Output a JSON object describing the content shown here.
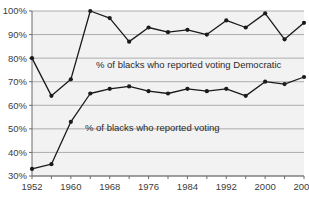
{
  "chart_data": {
    "type": "line",
    "title": "",
    "subtitle": "",
    "xlabel": "",
    "ylabel": "",
    "grid": true,
    "legend_position": "inline-annotations",
    "plot_background": "#f2f2f2",
    "series_color": "#1a1a1a",
    "xlim": [
      1952,
      2008
    ],
    "ylim": [
      30,
      100
    ],
    "x": [
      1952,
      1956,
      1960,
      1964,
      1968,
      1972,
      1976,
      1980,
      1984,
      1988,
      1992,
      1996,
      2000,
      2004,
      2008
    ],
    "xtick_labels": [
      "1952",
      "1960",
      "1968",
      "1976",
      "1984",
      "1992",
      "2000",
      "2008"
    ],
    "xticks": [
      1952,
      1960,
      1968,
      1976,
      1984,
      1992,
      2000,
      2008
    ],
    "ytick_labels": [
      "30%",
      "40%",
      "50%",
      "60%",
      "70%",
      "80%",
      "90%",
      "100%"
    ],
    "yticks": [
      30,
      40,
      50,
      60,
      70,
      80,
      90,
      100
    ],
    "series": [
      {
        "name": "% of blacks who reported voting Democratic",
        "annotation": "% of blacks who reported voting Democratic",
        "values": [
          80,
          64,
          71,
          100,
          97,
          87,
          93,
          91,
          92,
          90,
          96,
          93,
          99,
          88,
          95
        ]
      },
      {
        "name": "% of blacks who reported voting",
        "annotation": "% of blacks who reported voting",
        "values": [
          33,
          35,
          53,
          65,
          67,
          68,
          66,
          65,
          67,
          66,
          67,
          64,
          70,
          69,
          72
        ]
      }
    ]
  }
}
